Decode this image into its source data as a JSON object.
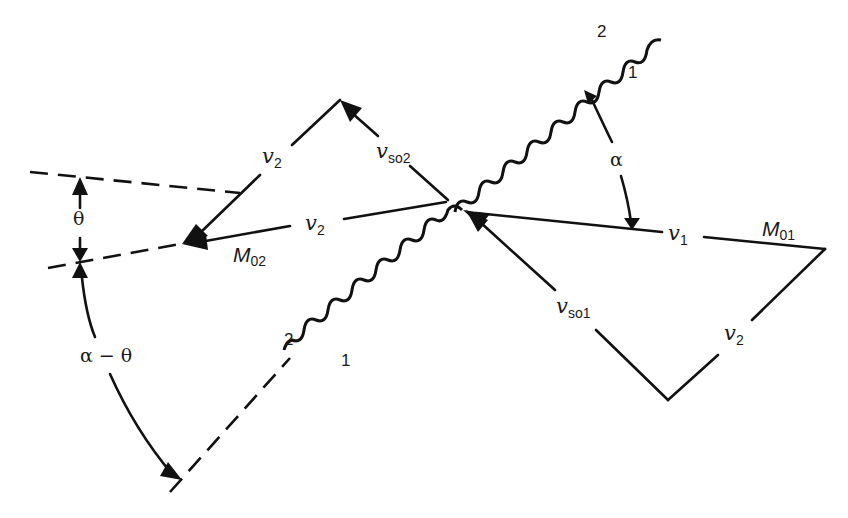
{
  "figure": {
    "labels": {
      "v2_upper": "v",
      "v2_upper_sub": "2",
      "vso2": "v",
      "vso2_sub": "so2",
      "v2_middle": "v",
      "v2_middle_sub": "2",
      "M02": "M",
      "M02_sub": "02",
      "v1": "v",
      "v1_sub": "1",
      "M01": "M",
      "M01_sub": "01",
      "vso1": "v",
      "vso1_sub": "so1",
      "v2_lower": "v",
      "v2_lower_sub": "2",
      "theta": "θ",
      "alpha": "α",
      "alpha_minus_theta": "α − θ",
      "upper_wave_side_2": "2",
      "upper_wave_side_1": "1",
      "lower_wave_side_2": "2",
      "lower_wave_side_1": "1"
    },
    "colors": {
      "ink": "#111111",
      "background": "#ffffff"
    }
  }
}
